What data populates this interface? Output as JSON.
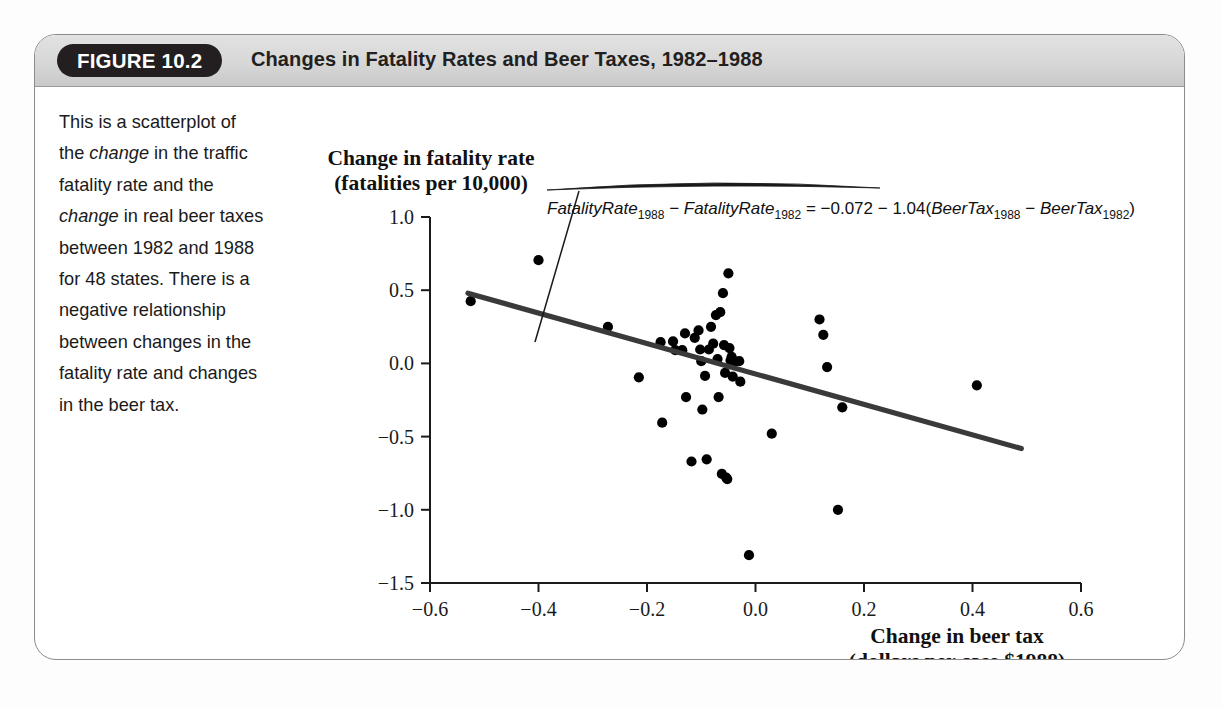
{
  "figure": {
    "badge": "FIGURE 10.2",
    "title": "Changes in Fatality Rates and Beer Taxes, 1982–1988",
    "caption_parts": [
      {
        "text": "This is a scatterplot of the ",
        "italic": false
      },
      {
        "text": "change",
        "italic": true
      },
      {
        "text": " in the traffic fatality rate and the ",
        "italic": false
      },
      {
        "text": "change",
        "italic": true
      },
      {
        "text": " in real beer taxes between 1982 and 1988 for 48 states. There is a negative relationship between changes in the fatality rate and changes in the beer tax.",
        "italic": false
      }
    ],
    "caption_plain": "This is a scatterplot of the change in the traffic fatality rate and the change in real beer taxes between 1982 and 1988 for 48 states. There is a negative relationship between changes in the fatality rate and changes in the beer tax.",
    "colors": {
      "header_band": "#d7d7d7",
      "badge_background": "#231f20",
      "frame_border": "#8c8c8c",
      "point": "#000000",
      "regression_line": "#3a3a3a"
    }
  },
  "chart_data": {
    "type": "scatter",
    "title": "",
    "ylabel_line1": "Change in fatality rate",
    "ylabel_line2": "(fatalities per 10,000)",
    "xlabel_line1": "Change in beer tax",
    "xlabel_line2": "(dollars per case $1988)",
    "xlim": [
      -0.6,
      0.6
    ],
    "ylim": [
      -1.5,
      1.0
    ],
    "xticks": [
      -0.6,
      -0.4,
      -0.2,
      0.0,
      0.2,
      0.4,
      0.6
    ],
    "xtick_labels": [
      "−0.6",
      "−0.4",
      "−0.2",
      "0.0",
      "0.2",
      "0.4",
      "0.6"
    ],
    "yticks": [
      1.0,
      0.5,
      0.0,
      -0.5,
      -1.0,
      -1.5
    ],
    "ytick_labels": [
      "1.0",
      "0.5",
      "0.0",
      "−0.5",
      "−1.0",
      "−1.5"
    ],
    "grid": false,
    "legend": "none",
    "n_points": 48,
    "points": [
      [
        -0.525,
        0.425
      ],
      [
        -0.4,
        0.705
      ],
      [
        -0.272,
        0.25
      ],
      [
        -0.215,
        -0.095
      ],
      [
        -0.175,
        0.145
      ],
      [
        -0.172,
        -0.405
      ],
      [
        -0.152,
        0.15
      ],
      [
        -0.148,
        0.09
      ],
      [
        -0.135,
        0.09
      ],
      [
        -0.13,
        0.205
      ],
      [
        -0.128,
        -0.23
      ],
      [
        -0.118,
        -0.67
      ],
      [
        -0.112,
        0.175
      ],
      [
        -0.105,
        0.225
      ],
      [
        -0.102,
        0.095
      ],
      [
        -0.1,
        0.015
      ],
      [
        -0.098,
        -0.315
      ],
      [
        -0.093,
        -0.085
      ],
      [
        -0.09,
        -0.655
      ],
      [
        -0.086,
        0.095
      ],
      [
        -0.082,
        0.25
      ],
      [
        -0.078,
        0.135
      ],
      [
        -0.073,
        0.33
      ],
      [
        -0.07,
        0.03
      ],
      [
        -0.068,
        -0.23
      ],
      [
        -0.065,
        0.35
      ],
      [
        -0.062,
        -0.755
      ],
      [
        -0.06,
        0.48
      ],
      [
        -0.058,
        0.125
      ],
      [
        -0.056,
        -0.065
      ],
      [
        -0.054,
        -0.78
      ],
      [
        -0.052,
        -0.79
      ],
      [
        -0.05,
        0.615
      ],
      [
        -0.048,
        0.105
      ],
      [
        -0.046,
        0.02
      ],
      [
        -0.044,
        0.045
      ],
      [
        -0.042,
        -0.09
      ],
      [
        -0.04,
        0.015
      ],
      [
        -0.038,
        0.01
      ],
      [
        -0.03,
        0.015
      ],
      [
        -0.028,
        -0.125
      ],
      [
        -0.012,
        -1.31
      ],
      [
        0.03,
        -0.48
      ],
      [
        0.118,
        0.3
      ],
      [
        0.125,
        0.195
      ],
      [
        0.132,
        -0.025
      ],
      [
        0.152,
        -1.0
      ],
      [
        0.16,
        -0.3
      ],
      [
        0.408,
        -0.15
      ]
    ],
    "regression": {
      "equation_lhs": "FatalityRate",
      "equation_sub1": "1988",
      "equation_sub2": "1982",
      "equation_rhs_var": "BeerTax",
      "intercept": -0.072,
      "slope": -1.04,
      "equation_text": "FatalityRate1988 − FatalityRate1982 = −0.072 − 1.04(BeerTax1988 − BeerTax1982)",
      "line_x_start": -0.53,
      "line_x_end": 0.49
    }
  }
}
